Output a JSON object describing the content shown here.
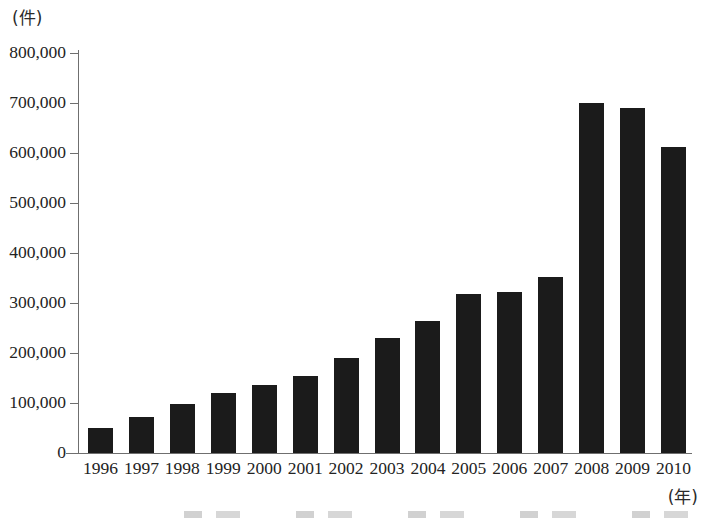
{
  "chart_data": {
    "type": "bar",
    "title": "",
    "subtitle": "",
    "xlabel": "(年)",
    "ylabel": "(件)",
    "categories": [
      "1996",
      "1997",
      "1998",
      "1999",
      "2000",
      "2001",
      "2002",
      "2003",
      "2004",
      "2005",
      "2006",
      "2007",
      "2008",
      "2009",
      "2010"
    ],
    "values": [
      50000,
      72000,
      98000,
      120000,
      136000,
      154000,
      190000,
      230000,
      265000,
      318000,
      322000,
      352000,
      700000,
      690000,
      612000
    ],
    "ylim": [
      0,
      800000
    ],
    "ytick_values": [
      0,
      100000,
      200000,
      300000,
      400000,
      500000,
      600000,
      700000,
      800000
    ],
    "ytick_labels": [
      "0",
      "100,000",
      "200,000",
      "300,000",
      "400,000",
      "500,000",
      "600,000",
      "700,000",
      "800,000"
    ],
    "grid": false,
    "legend": null,
    "legend_position": "none",
    "series": [
      {
        "name": "件数",
        "color": "#1b1b1b",
        "values": [
          50000,
          72000,
          98000,
          120000,
          136000,
          154000,
          190000,
          230000,
          265000,
          318000,
          322000,
          352000,
          700000,
          690000,
          612000
        ]
      }
    ]
  },
  "axes": {
    "y_unit_label": "(件)",
    "x_unit_label": "(年)"
  },
  "colors": {
    "bar": "#1b1b1b",
    "axis": "#6f6f6f",
    "text": "#232323",
    "background": "#ffffff"
  }
}
